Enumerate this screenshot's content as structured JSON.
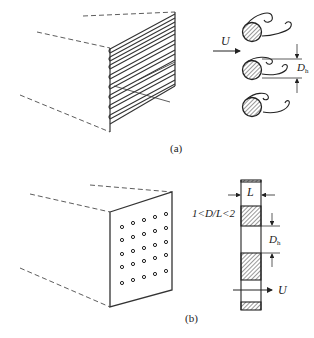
{
  "figure": {
    "panel_a": {
      "caption": "(a)",
      "flow_label": "U",
      "spacing_label": "D",
      "spacing_subscript": "h",
      "description": "Duct inlet fitted with a row of parallel rods/cylinders (tube bundle) shedding vortices"
    },
    "panel_b": {
      "caption": "(b)",
      "ratio_label": "1<D/L<2",
      "thickness_label": "L",
      "spacing_label": "D",
      "spacing_subscript": "h",
      "flow_label": "U",
      "hole_grid": {
        "rows": 5,
        "cols": 5
      },
      "description": "Duct inlet fitted with a perforated plate; side section showing plate thickness L and hole diameter D"
    },
    "colors": {
      "stroke": "#222222",
      "background": "#ffffff"
    }
  }
}
